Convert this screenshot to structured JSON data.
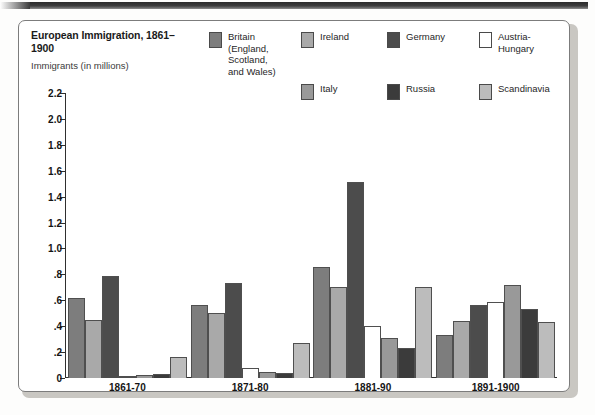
{
  "chart_data": {
    "type": "bar",
    "title": "European Immigration,\n1861–1900",
    "subtitle": "Immigrants\n(in millions)",
    "xlabel": "",
    "ylabel": "Immigrants (in millions)",
    "ylim": [
      0,
      2.2
    ],
    "grid": false,
    "legend_position": "top",
    "ytick_labels": [
      "2.2",
      "2.0",
      "1.8",
      "1.6",
      "1.4",
      "1.2",
      "1.0",
      ".8",
      ".6",
      ".4",
      ".2",
      "0"
    ],
    "ytick_values": [
      2.2,
      2.0,
      1.8,
      1.6,
      1.4,
      1.2,
      1.0,
      0.8,
      0.6,
      0.4,
      0.2,
      0
    ],
    "categories": [
      "1861-70",
      "1871-80",
      "1881-90",
      "1891-1900"
    ],
    "series": [
      {
        "name": "Britain (England, Scotland, and Wales)",
        "short": "Britain",
        "color": "#7d7d7d",
        "values": [
          0.62,
          0.56,
          0.86,
          0.33
        ]
      },
      {
        "name": "Ireland",
        "short": "Ireland",
        "color": "#a9a9a9",
        "values": [
          0.45,
          0.5,
          0.7,
          0.44
        ]
      },
      {
        "name": "Germany",
        "short": "Germany",
        "color": "#4c4c4c",
        "values": [
          0.79,
          0.73,
          1.51,
          0.56
        ]
      },
      {
        "name": "Austria-Hungary",
        "short": "Austria-Hungary",
        "color": "#ffffff",
        "values": [
          0.005,
          0.08,
          0.4,
          0.59
        ]
      },
      {
        "name": "Italy",
        "short": "Italy",
        "color": "#999999",
        "values": [
          0.02,
          0.05,
          0.31,
          0.72
        ]
      },
      {
        "name": "Russia",
        "short": "Russia",
        "color": "#3b3b3b",
        "values": [
          0.03,
          0.04,
          0.23,
          0.53
        ]
      },
      {
        "name": "Scandinavia",
        "short": "Scandinavia",
        "color": "#bcbcbc",
        "values": [
          0.16,
          0.27,
          0.7,
          0.43
        ]
      }
    ]
  },
  "legend": {
    "items": [
      {
        "label": "Britain\n(England,\nScotland,\nand Wales)",
        "color": "#7d7d7d"
      },
      {
        "label": "Ireland",
        "color": "#a9a9a9"
      },
      {
        "label": "Germany",
        "color": "#4c4c4c"
      },
      {
        "label": "Austria-Hungary",
        "color": "#ffffff"
      },
      {
        "label": "Italy",
        "color": "#999999"
      },
      {
        "label": "Russia",
        "color": "#3b3b3b"
      },
      {
        "label": "Scandinavia",
        "color": "#bcbcbc"
      }
    ]
  }
}
